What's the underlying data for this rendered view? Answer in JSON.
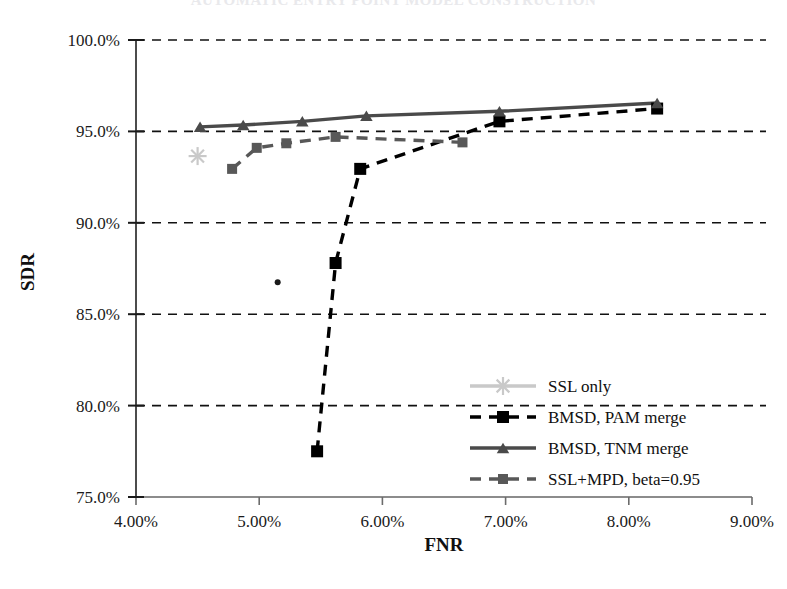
{
  "chart_data": {
    "type": "scatter",
    "title": "AUTOMATIC ENTRY POINT MODEL CONSTRUCTION",
    "xlabel": "FNR",
    "ylabel": "SDR",
    "xlim": [
      4.0,
      9.0
    ],
    "ylim": [
      75.0,
      100.0
    ],
    "xticks": [
      "4.00%",
      "5.00%",
      "6.00%",
      "7.00%",
      "8.00%",
      "9.00%"
    ],
    "xtick_values": [
      4.0,
      5.0,
      6.0,
      7.0,
      8.0,
      9.0
    ],
    "yticks": [
      "75.0%",
      "80.0%",
      "85.0%",
      "90.0%",
      "95.0%",
      "100.0%"
    ],
    "ytick_values": [
      75.0,
      80.0,
      85.0,
      90.0,
      95.0,
      100.0
    ],
    "grid": "horizontal-dashed",
    "legend_position": "bottom-right",
    "series": [
      {
        "name": "SSL only",
        "marker": "asterisk",
        "color": "#c9c9c9",
        "line": "solid",
        "points": [
          [
            4.5,
            93.65
          ]
        ]
      },
      {
        "name": "BMSD, PAM merge",
        "marker": "square",
        "color": "#000000",
        "line": "dashed",
        "points": [
          [
            5.47,
            77.5
          ],
          [
            5.62,
            87.8
          ],
          [
            5.82,
            92.95
          ],
          [
            6.95,
            95.55
          ],
          [
            8.23,
            96.25
          ]
        ]
      },
      {
        "name": "BMSD, TNM merge",
        "marker": "triangle",
        "color": "#4a4a4a",
        "line": "solid",
        "points": [
          [
            4.52,
            95.25
          ],
          [
            4.87,
            95.35
          ],
          [
            5.35,
            95.55
          ],
          [
            5.87,
            95.85
          ],
          [
            6.95,
            96.1
          ],
          [
            8.23,
            96.55
          ]
        ]
      },
      {
        "name": "SSL+MPD, beta=0.95",
        "marker": "square",
        "color": "#585858",
        "line": "dashed",
        "points": [
          [
            4.78,
            92.95
          ],
          [
            4.98,
            94.1
          ],
          [
            5.22,
            94.35
          ],
          [
            5.62,
            94.7
          ],
          [
            6.65,
            94.4
          ]
        ]
      }
    ],
    "extra_points": [
      {
        "name": "unlabeled-dot",
        "x": 5.15,
        "y": 86.75,
        "color": "#1a1a1a"
      }
    ]
  }
}
